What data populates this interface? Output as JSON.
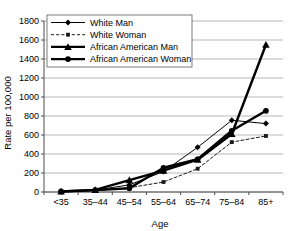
{
  "chart_data": {
    "type": "line",
    "title": "",
    "xlabel": "Age",
    "ylabel": "Rate per 100,000",
    "categories": [
      "<35",
      "35–44",
      "45–54",
      "55–64",
      "65–74",
      "75–84",
      "85+"
    ],
    "ylim": [
      0,
      1800
    ],
    "ytick_step": 200,
    "yticks": [
      "0",
      "200",
      "400",
      "600",
      "800",
      "1000",
      "1200",
      "1400",
      "1600",
      "1800"
    ],
    "grid": true,
    "legend_position": "top-left",
    "series": [
      {
        "name": "White Man",
        "marker": "diamond",
        "line_style": "solid",
        "line_width": "thin",
        "color": "#000000",
        "values": [
          5,
          20,
          75,
          215,
          470,
          755,
          720
        ]
      },
      {
        "name": "White Woman",
        "marker": "square",
        "line_style": "dashed",
        "line_width": "thin",
        "color": "#1a1a1a",
        "values": [
          4,
          14,
          45,
          105,
          245,
          525,
          590
        ]
      },
      {
        "name": "African American Man",
        "marker": "triangle",
        "line_style": "solid",
        "line_width": "thick",
        "color": "#000000",
        "values": [
          6,
          22,
          125,
          225,
          340,
          610,
          1550
        ]
      },
      {
        "name": "African American Woman",
        "marker": "circle",
        "line_style": "solid",
        "line_width": "thick",
        "color": "#000000",
        "values": [
          6,
          20,
          40,
          255,
          345,
          645,
          855
        ]
      }
    ]
  },
  "legend": {
    "items": [
      {
        "label": "White Man"
      },
      {
        "label": "White Woman"
      },
      {
        "label": "African American Man"
      },
      {
        "label": "African American Woman"
      }
    ]
  },
  "axes": {
    "x_title": "Age",
    "y_title": "Rate per 100,000"
  }
}
